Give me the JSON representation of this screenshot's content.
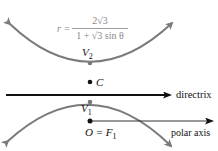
{
  "diagram": {
    "formula": {
      "lhs": "r =",
      "numerator": "2√3",
      "denominator": "1 + √3 sin θ"
    },
    "points": {
      "v2": "V",
      "v2_sub": "2",
      "c": "C",
      "v1": "V",
      "v1_sub": "1",
      "origin": "O = F",
      "origin_sub": "1"
    },
    "lines": {
      "directrix": "directrix",
      "polar_axis": "polar axis"
    },
    "colors": {
      "curve": "#7a7a7a",
      "line": "#111111",
      "formula": "#888888"
    }
  }
}
